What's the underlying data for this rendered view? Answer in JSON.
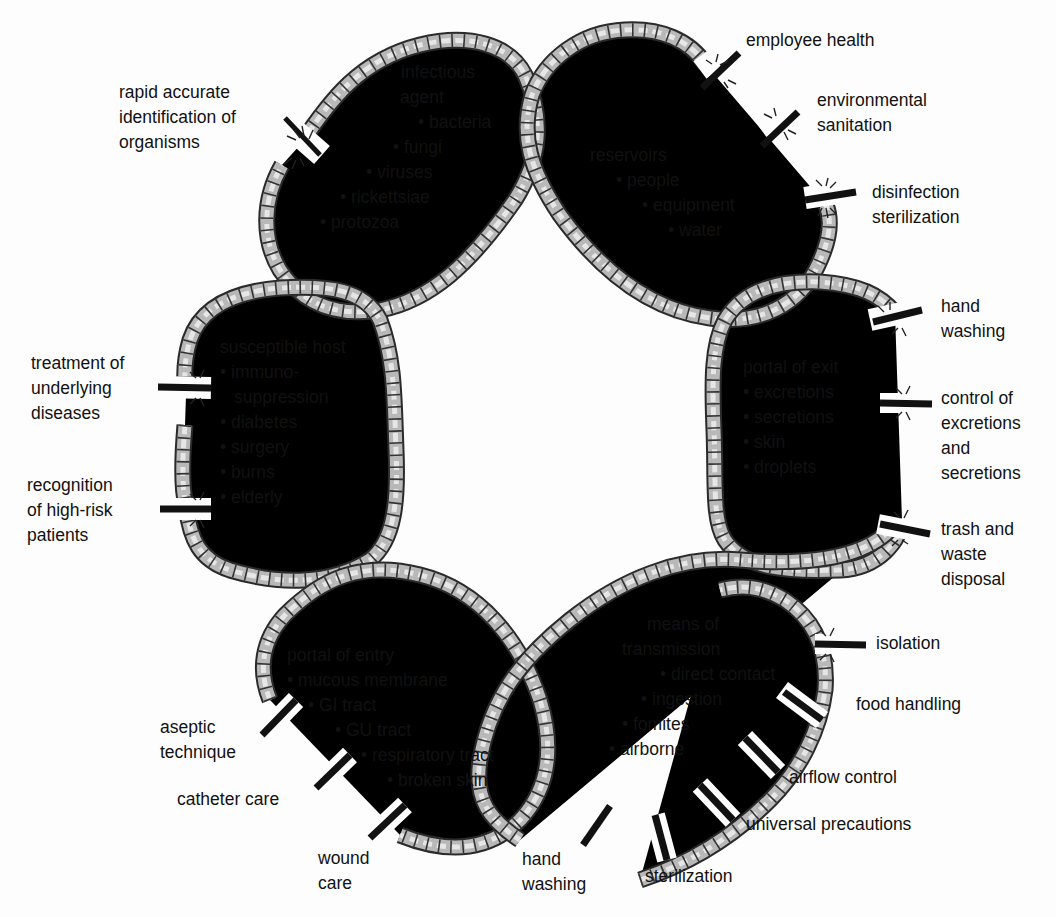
{
  "diagram": {
    "colors": {
      "rope_light": "#d9d9d9",
      "rope_dark": "#555555",
      "rope_outline": "#2a2a2a",
      "cut_bar": "#111111",
      "text": "#111111",
      "background": "#fdfdfd"
    },
    "links": {
      "infectious_agent": {
        "heading": [
          "infectious",
          "agent"
        ],
        "items": [
          "bacteria",
          "fungi",
          "viruses",
          "rickettsiae",
          "protozoa"
        ]
      },
      "reservoirs": {
        "heading": [
          "reservoirs"
        ],
        "items": [
          "people",
          "equipment",
          "water"
        ]
      },
      "portal_of_exit": {
        "heading": [
          "portal of exit"
        ],
        "items": [
          "excretions",
          "secretions",
          "skin",
          "droplets"
        ]
      },
      "means_of_transmission": {
        "heading": [
          "means of",
          "transmission"
        ],
        "items": [
          "direct contact",
          "ingestion",
          "fomites",
          "airborne"
        ]
      },
      "portal_of_entry": {
        "heading": [
          "portal of entry"
        ],
        "items": [
          "mucous membrane",
          "GI tract",
          "GU tract",
          "respiratory tract",
          "broken skin"
        ]
      },
      "susceptible_host": {
        "heading": [
          "susceptible host"
        ],
        "items": [
          "immuno-",
          "suppression",
          "diabetes",
          "surgery",
          "burns",
          "elderly"
        ]
      }
    },
    "interventions": {
      "rapid_identification": [
        "rapid accurate",
        "identification of",
        "organisms"
      ],
      "employee_health": [
        "employee health"
      ],
      "environmental_sanitation": [
        "environmental",
        "sanitation"
      ],
      "disinfection_sterilization": [
        "disinfection",
        "sterilization"
      ],
      "hand_washing_exit": [
        "hand",
        "washing"
      ],
      "control_excretions": [
        "control of",
        "excretions",
        "and",
        "secretions"
      ],
      "trash_waste": [
        "trash and",
        "waste",
        "disposal"
      ],
      "isolation": [
        "isolation"
      ],
      "food_handling": [
        "food handling"
      ],
      "airflow_control": [
        "airflow control"
      ],
      "universal_precautions": [
        "universal precautions"
      ],
      "sterilization": [
        "sterilization"
      ],
      "hand_washing_transmission": [
        "hand",
        "washing"
      ],
      "wound_care": [
        "wound",
        "care"
      ],
      "catheter_care": [
        "catheter care"
      ],
      "aseptic_technique": [
        "aseptic",
        "technique"
      ],
      "treatment_underlying": [
        "treatment of",
        "underlying",
        "diseases"
      ],
      "recognition_high_risk": [
        "recognition",
        "of high-risk",
        "patients"
      ]
    }
  }
}
